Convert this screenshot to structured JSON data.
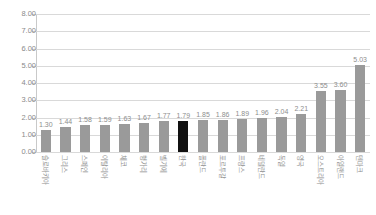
{
  "chart": {
    "title": "",
    "type": "bar"
  },
  "axes": {
    "y_ticks": [
      "0.00",
      "1.00",
      "2.00",
      "3.00",
      "4.00",
      "5.00",
      "6.00",
      "7.00",
      "8.00"
    ]
  },
  "chart_data": {
    "type": "bar",
    "title": "",
    "xlabel": "",
    "ylabel": "",
    "ylim": [
      0,
      8
    ],
    "ytick_step": 1.0,
    "ytick_labels": [
      "0.00",
      "1.00",
      "2.00",
      "3.00",
      "4.00",
      "5.00",
      "6.00",
      "7.00",
      "8.00"
    ],
    "grid": true,
    "legend": "none",
    "highlight_index": 7,
    "highlight_color": "#111111",
    "bar_color": "#9a9a9a",
    "categories": [
      "슬로바키아",
      "그리스",
      "스페인",
      "이탈리아",
      "체코",
      "헝가리",
      "벨기에",
      "한국",
      "폴란드",
      "포르투갈",
      "프랑스",
      "네덜란드",
      "독일",
      "영국",
      "오스트리아",
      "아일랜드",
      "덴마크"
    ],
    "values": [
      1.3,
      1.44,
      1.58,
      1.59,
      1.63,
      1.67,
      1.77,
      1.79,
      1.85,
      1.86,
      1.89,
      1.96,
      2.04,
      2.21,
      3.55,
      3.6,
      5.03
    ],
    "value_labels": [
      "1.30",
      "1.44",
      "1.58",
      "1.59",
      "1.63",
      "1.67",
      "1.77",
      "1.79",
      "1.85",
      "1.86",
      "1.89",
      "1.96",
      "2.04",
      "2.21",
      "3.55",
      "3.60",
      "5.03"
    ]
  }
}
